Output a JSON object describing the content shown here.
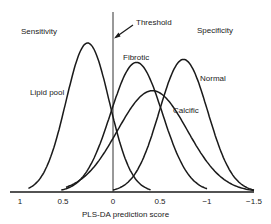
{
  "chart_data": {
    "type": "line",
    "title": "",
    "xlabel": "PLS-DA prediction score",
    "ylabel": "",
    "x_tick_labels": [
      "1",
      "0.5",
      "0",
      "0.5",
      "−1",
      "−1.5"
    ],
    "x_tick_values": [
      1,
      0.5,
      0,
      -0.5,
      -1,
      -1.5
    ],
    "xlim": [
      1.1,
      -1.5
    ],
    "x_axis_reversed": true,
    "grid": false,
    "legend": "inline labels",
    "annotations": [
      {
        "text": "Threshold",
        "x": 0,
        "type": "vertical-line-with-arrow"
      },
      {
        "text": "Sensitivity",
        "position": "upper-left"
      },
      {
        "text": "Specificity",
        "position": "upper-right"
      }
    ],
    "series": [
      {
        "name": "Lipid pool",
        "shape": "gaussian",
        "peak_x": 0.27,
        "peak_height": 1.0,
        "range": [
          0.9,
          -0.4
        ]
      },
      {
        "name": "Fibrotic",
        "shape": "gaussian",
        "peak_x": -0.25,
        "peak_height": 0.87,
        "range": [
          0.55,
          -1.0
        ]
      },
      {
        "name": "Calcific",
        "shape": "gaussian",
        "peak_x": -0.42,
        "peak_height": 0.68,
        "range": [
          0.5,
          -1.5
        ]
      },
      {
        "name": "Normal",
        "shape": "gaussian",
        "peak_x": -0.75,
        "peak_height": 0.89,
        "range": [
          0.0,
          -1.5
        ]
      }
    ]
  },
  "labels": {
    "sensitivity": "Sensitivity",
    "specificity": "Specificity",
    "threshold": "Threshold",
    "lipid_pool": "Lipid pool",
    "fibrotic": "Fibrotic",
    "normal": "Normal",
    "calcific": "Calcific",
    "xlabel": "PLS-DA prediction score"
  },
  "ticks": [
    "1",
    "0.5",
    "0",
    "0.5",
    "−1",
    "−1.5"
  ],
  "colors": {
    "curve": "#1a1a1a",
    "axis": "#1a1a1a",
    "threshold": "#333333"
  }
}
